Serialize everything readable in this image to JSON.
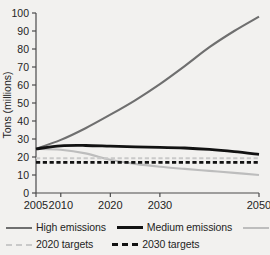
{
  "chart_data": {
    "type": "line",
    "title": "",
    "subtitle": "",
    "xlabel": "",
    "ylabel": "Tons (millions)",
    "xlim": [
      2005,
      2050
    ],
    "ylim": [
      0,
      100
    ],
    "grid": false,
    "legend_position": "bottom",
    "xticks": [
      2005,
      2010,
      2020,
      2030,
      2050
    ],
    "xticklabels": [
      "2005",
      "2010",
      "2020",
      "2030",
      "2050"
    ],
    "yticks": [
      0,
      10,
      20,
      30,
      40,
      50,
      60,
      70,
      80,
      90,
      100
    ],
    "yticklabels": [
      "0",
      "10",
      "20",
      "30",
      "40",
      "50",
      "60",
      "70",
      "80",
      "90",
      "100"
    ],
    "x": [
      2005,
      2010,
      2015,
      2020,
      2025,
      2030,
      2035,
      2040,
      2045,
      2050
    ],
    "series": [
      {
        "name": "High emissions",
        "style": "solid",
        "color": "#6f6f6f",
        "width": 2.1,
        "values": [
          24.5,
          29.5,
          36.0,
          43.5,
          51.5,
          60.5,
          70.5,
          81.0,
          90.0,
          98.0
        ]
      },
      {
        "name": "Medium emissions",
        "style": "solid",
        "color": "#121212",
        "width": 2.8,
        "values": [
          24.5,
          26.2,
          26.4,
          26.0,
          25.6,
          25.4,
          25.0,
          24.2,
          23.0,
          21.5
        ]
      },
      {
        "name": "Low emissions",
        "style": "solid",
        "color": "#bdbdbd",
        "width": 2.1,
        "values": [
          24.5,
          24.0,
          22.0,
          18.5,
          16.2,
          14.6,
          13.4,
          12.3,
          11.2,
          10.0
        ]
      },
      {
        "name": "2020 targets",
        "style": "dashed",
        "color": "#c9c9c9",
        "width": 2.0,
        "constant": 19.3
      },
      {
        "name": "2030 targets",
        "style": "dashed",
        "color": "#121212",
        "width": 2.6,
        "constant": 17.0
      }
    ]
  },
  "axis": {
    "ylabel": "Tons (millions)"
  },
  "legend": {
    "row1": [
      {
        "label": "High emissions",
        "icon": "line-swatch-solid-gray"
      },
      {
        "label": "Medium emissions",
        "icon": "line-swatch-solid-black"
      },
      {
        "label": "Low emissions",
        "icon": "line-swatch-solid-lightgray"
      }
    ],
    "row2": [
      {
        "label": "2020 targets",
        "icon": "line-swatch-dashed-lightgray"
      },
      {
        "label": "2030 targets",
        "icon": "line-swatch-dashed-black"
      }
    ]
  },
  "colors": {
    "background": "#f2f1ef",
    "high": "#6f6f6f",
    "medium": "#121212",
    "low": "#bdbdbd",
    "target2020": "#c9c9c9",
    "target2030": "#121212",
    "axis": "#4a4a4a",
    "text": "#242424"
  }
}
